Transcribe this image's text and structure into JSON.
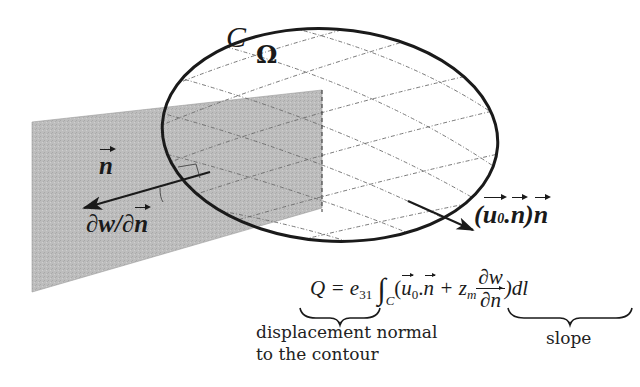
{
  "figure": {
    "labels": {
      "contour": "C",
      "domain": "Ω",
      "normal_vector": "n",
      "slope_label_d1": "∂w/∂",
      "slope_label_n": "n",
      "displacement_open": "(",
      "displacement_u": "u",
      "displacement_u_sub": "0",
      "displacement_dot": ".",
      "displacement_n": "n",
      "displacement_close": ")",
      "displacement_n2": "n"
    },
    "equation": {
      "lhs": "Q = e",
      "lhs_sub": "31",
      "integral": "∫",
      "integral_sub": "C",
      "open_paren": "(",
      "u": "u",
      "u_sub": "0",
      "dot": ".",
      "n": "n",
      "plus": "+ z",
      "z_sub": "m",
      "frac_num": "∂w",
      "frac_den_d": "∂",
      "frac_den_n": "n",
      "close": ")dl"
    },
    "annotations": {
      "displacement_line1": "displacement normal",
      "displacement_line2": "to the contour",
      "slope": "slope"
    },
    "colors": {
      "ink": "#1a1a1a",
      "plane_fill": "#b9b9b9",
      "grid": "#6a6a6a"
    }
  }
}
